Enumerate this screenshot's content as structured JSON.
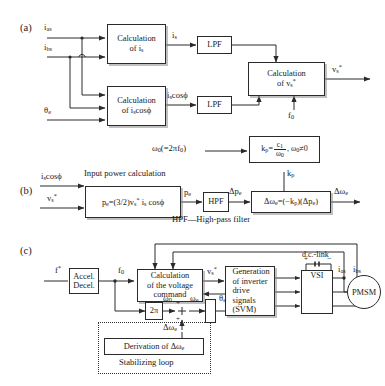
{
  "figure": {
    "sections": [
      {
        "tag": "(a)",
        "name": "current-and-voltage-calculation"
      },
      {
        "tag": "(b)",
        "name": "stabilizing-loop-derivation"
      },
      {
        "tag": "(c)",
        "name": "overall-drive-system"
      }
    ]
  },
  "panel_a": {
    "inputs": [
      {
        "label": "i",
        "sub": "as"
      },
      {
        "label": "i",
        "sub": "bs"
      },
      {
        "label": "θ",
        "sub": "e"
      }
    ],
    "blocks": [
      {
        "line1": "Calculation",
        "line2": "of i",
        "line2_sub": "s",
        "name": "calculation-of-is"
      },
      {
        "line1": "Calculation",
        "line2": "of i",
        "line2_sub": "s",
        "line2_tail": "cosϕ",
        "name": "calculation-of-is-cos-phi"
      },
      {
        "text": "LPF",
        "name": "lpf-upper"
      },
      {
        "text": "LPF",
        "name": "lpf-lower"
      },
      {
        "line1": "Calculation",
        "line2": "of v",
        "line2_sub": "s",
        "line2_sup": "*",
        "name": "calculation-of-vs-ref"
      }
    ],
    "signals": {
      "is": "i",
      "is_sub": "s",
      "iscos": "i",
      "iscos_sub": "s",
      "iscos_tail": "cosϕ",
      "vs": "v",
      "vs_sub": "s",
      "vs_sup": "*",
      "f0": "f",
      "f0_sub": "0"
    }
  },
  "panel_b": {
    "inputs": [
      {
        "label": "i",
        "sub": "s",
        "tail": "cosϕ"
      },
      {
        "label": "v",
        "sub": "s",
        "sup": "*"
      }
    ],
    "heading": "Input power calculation",
    "caption": "HPF—High-pass filter",
    "omega0_label": "ω",
    "omega0_sub": "0",
    "omega0_tail": "(=2πf",
    "omega0_tail_sub": "0",
    "omega0_tail_end": ")",
    "kp_block": {
      "lhs": "k",
      "lhs_sub": "p",
      "eq": "=",
      "num": "c",
      "num_sub": "1",
      "den": "ω",
      "den_sub": "0",
      "cond": ", ω",
      "cond_sub": "0",
      "cond_tail": "≠0",
      "name": "kp-gain-block"
    },
    "kp_arrow_label": "k",
    "kp_arrow_sub": "p",
    "power_block": {
      "text": "p",
      "sub": "e",
      "eq": "=(3/2)v",
      "v_sub": "s",
      "v_sup": "*",
      "tail": " i",
      "tail_sub": "s",
      "tail_end": " cosϕ",
      "name": "input-power-block"
    },
    "pe": "p",
    "pe_sub": "e",
    "hpf": "HPF",
    "dpe": "Δp",
    "dpe_sub": "e",
    "domega_block": {
      "text": "Δω",
      "sub": "e",
      "eq": "=(−k",
      "eq_sub": "p",
      "mid": ")(Δp",
      "mid_sub": "e",
      "end": ")",
      "name": "delta-omega-block"
    },
    "domega_out": "Δω",
    "domega_out_sub": "e"
  },
  "panel_c": {
    "input_ref": "f",
    "input_ref_sup": "*",
    "blocks": [
      {
        "line1": "Accel.",
        "line2": "Decel.",
        "name": "accel-decel-block"
      },
      {
        "line1": "Calculation",
        "line2": "of the voltage",
        "line3": "command",
        "name": "voltage-command-block"
      },
      {
        "line1": "Generation",
        "line2": "of inverter",
        "line3": "drive",
        "line4": "signals",
        "line5": "(SVM)",
        "name": "svm-generation-block"
      },
      {
        "text": "2π",
        "name": "two-pi-gain-block"
      },
      {
        "text": "VSI",
        "name": "vsi-block"
      },
      {
        "text": "PMSM",
        "name": "pmsm-machine"
      },
      {
        "text": "Derivation of Δω",
        "sub": "e",
        "name": "derivation-block"
      }
    ],
    "labels": {
      "f0": "f",
      "f0_sub": "0",
      "omega0": "ω",
      "omega0_sub": "0",
      "omegae": "ω",
      "omegae_sub": "e",
      "thetae": "θ",
      "thetae_sub": "e",
      "vs": "v",
      "vs_sub": "s",
      "vs_sup": "*",
      "dclink": "d.c.-link",
      "ias": "i",
      "ias_sub": "as",
      "ibs": "i",
      "ibs_sub": "bs",
      "domega": "Δω",
      "domega_sub": "e",
      "stabilizing": "Stabilizing loop",
      "plus": "+",
      "minus": "+",
      "dc_plus": "+",
      "dc_minus": "−"
    }
  },
  "colors": {
    "stroke": "#2a2a2a",
    "background": "#ffffff",
    "shadow": "#8c8c8c"
  }
}
